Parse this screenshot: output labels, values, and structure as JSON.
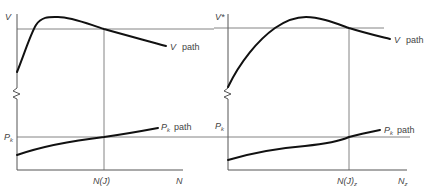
{
  "panels": [
    {
      "id": "left",
      "y_label_top": "V",
      "y_label_bottom": "P",
      "y_label_bottom_sub": "k",
      "x_mark_label": "N(J)",
      "x_axis_label": "N",
      "upper_curve_label": "V",
      "upper_curve_suffix": "path",
      "lower_curve_label": "P",
      "lower_curve_sub": "k",
      "lower_curve_suffix": "path"
    },
    {
      "id": "right",
      "y_label_top": "V*",
      "y_label_bottom": "P",
      "y_label_bottom_sub": "k",
      "x_mark_label": "N(J)",
      "x_mark_sub": "z",
      "x_axis_label": "N",
      "x_axis_sub": "z",
      "upper_curve_label": "V",
      "upper_curve_suffix": "path",
      "lower_curve_label": "P",
      "lower_curve_sub": "k",
      "lower_curve_suffix": "path"
    }
  ],
  "colors": {
    "curve": "#111111",
    "axis": "#555555",
    "reference": "#666666",
    "text": "#444444"
  }
}
